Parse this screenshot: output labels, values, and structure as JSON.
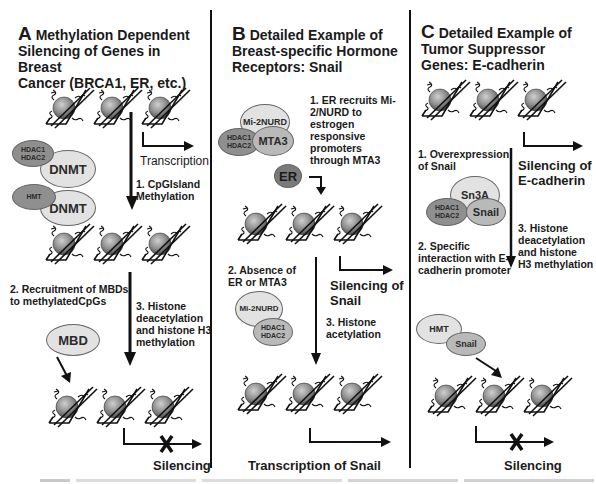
{
  "panels": {
    "A": {
      "letter": "A",
      "title_line1": "Methylation Dependent",
      "title_line2": "Silencing of Genes in Breast",
      "title_line3": "Cancer (BRCA1, ER, etc.)",
      "transcription_label": "Transcription",
      "step1_line1": "1. CpGIsland",
      "step1_line2": "Methylation",
      "step2_line1": "2. Recruitment of MBDs",
      "step2_line2": "to methylatedCpGs",
      "step3_line1": "3. Histone",
      "step3_line2": "deacetylation",
      "step3_line3": "and histone H3",
      "step3_line4": "methylation",
      "outcome": "Silencing",
      "complex1": {
        "small_line1": "HDAC1",
        "small_line2": "HDAC2",
        "large": "DNMT"
      },
      "complex2": {
        "small": "HMT",
        "large": "DNMT"
      },
      "mbd": "MBD"
    },
    "B": {
      "letter": "B",
      "title_line1": "Detailed Example of",
      "title_line2": "Breast-specific Hormone",
      "title_line3": "Receptors: Snail",
      "complex1": {
        "top": "Mi-2NURD",
        "left_line1": "HDAC1",
        "left_line2": "HDAC2",
        "right": "MTA3"
      },
      "er": "ER",
      "step1_line1": "1. ER recruits Mi-",
      "step1_line2": "2/NURD to",
      "step1_line3": "estrogen",
      "step1_line4": "responsive",
      "step1_line5": "promoters",
      "step1_line6": "through MTA3",
      "step2_line1": "2. Absence of",
      "step2_line2": "ER or MTA3",
      "silencing_line1": "Silencing of",
      "silencing_line2": "Snail",
      "complex2": {
        "top": "Mi-2NURD",
        "bottom_line1": "HDAC1",
        "bottom_line2": "HDAC2"
      },
      "step3_line1": "3. Histone",
      "step3_line2": "acetylation",
      "outcome": "Transcription of Snail"
    },
    "C": {
      "letter": "C",
      "title_line1": "Detailed Example of",
      "title_line2": "Tumor Suppressor",
      "title_line3": "Genes: E-cadherin",
      "step1_line1": "1. Overexpression",
      "step1_line2": "of Snail",
      "silencing_line1": "Silencing of",
      "silencing_line2": "E-cadherin",
      "complex1": {
        "top": "Sn3A",
        "left_line1": "HDAC1",
        "left_line2": "HDAC2",
        "right": "Snail"
      },
      "step2_line1": "2. Specific",
      "step2_line2": "interaction with E-",
      "step2_line3": "cadherin promoter",
      "step3_line1": "3. Histone",
      "step3_line2": "deacetylation",
      "step3_line3": "and histone",
      "step3_line4": "H3 methylation",
      "complex2": {
        "top": "HMT",
        "bottom": "Snail"
      },
      "outcome": "Silencing"
    }
  },
  "colors": {
    "light_protein": "#e2e2e2",
    "mid_protein": "#b9b9b9",
    "dark_protein": "#8f8f8f",
    "ink": "#111111"
  }
}
